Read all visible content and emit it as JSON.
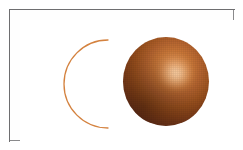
{
  "figure": {
    "background_color": "#ffffff",
    "frame_color": "#8a8a8c",
    "frame": {
      "x": 9,
      "y": 9,
      "width": 225,
      "height": 132
    }
  },
  "shapes": [
    {
      "id": "crescent-arc",
      "name": "crescent-arc",
      "type": "arc",
      "description": "Thin open C-shaped arc outline, opening toward the right",
      "stroke_color": "#d4823f",
      "stroke_width": 1.3,
      "fill": "none",
      "center": {
        "x": 97,
        "y": 74
      },
      "radius": 44,
      "start_angle_deg": 300,
      "end_angle_deg": 60,
      "sweep_deg": 240,
      "endpoint_top": {
        "x": 98,
        "y": 30
      },
      "endpoint_bottom": {
        "x": 98,
        "y": 118
      },
      "leftmost": {
        "x": 53,
        "y": 74
      }
    },
    {
      "id": "shaded-sphere",
      "name": "shaded-sphere",
      "type": "sphere",
      "description": "Fully rendered 3D sphere with diffuse shading and specular highlight",
      "center": {
        "x": 156,
        "y": 71
      },
      "diameter": 86,
      "bounds": {
        "left": 113,
        "top": 27,
        "right": 199,
        "bottom": 116
      },
      "highlight_center": {
        "x": 163,
        "y": 60
      },
      "light_direction": "upper-right",
      "colors": {
        "highlight": "#f4b178",
        "midtone": "#b86630",
        "base": "#a1551f",
        "terminator": "#73361a",
        "darkest": "#4f2513"
      }
    }
  ],
  "svg_paths": {
    "arc_path": "M 88,20 A 44 44 0 1 0 88,108"
  }
}
